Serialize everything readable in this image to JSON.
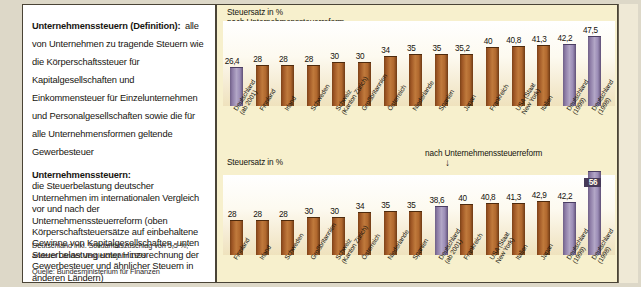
{
  "left_panel": {
    "definitions": [
      {
        "title": "Unternehmenssteuern (Definition):",
        "body": "alle von Unternehmen zu tragende Steuern wie die Körperschaftssteuer für Kapitalgesellschaften und Einkommensteuer für Einzelunternehmen und Personalgesellschaften sowie die für alle Unternehmensformen geltende Gewerbesteuer"
      },
      {
        "title": "Unternehmenssteuern:",
        "body": "die Steuerbelastung deutscher Unternehmen im internationalen Vergleich vor und nach der Unternehmenssteuerreform (oben Körperschaftsteuersätze auf einbehaltene Gewinne von Kapitalgesellschaften, unten Steuerbelastung unter Hinzurechnung der Gewerbesteuer und ähnlicher Steuern in anderen Ländern)"
      }
    ],
    "footnotes": [
      "Deutschland inkl. Solidaritätszuschlag von 5,5 %;",
      "anderer Länder Vergleichsjahr 1999"
    ],
    "source": "Quelle: Bundesministerium für Finanzen"
  },
  "colors": {
    "bar_default": "#a8632c",
    "bar_germany": "#9b8cb6",
    "panel_background": "#f7f0cd",
    "plot_background": "#ffffff",
    "text": "#14120c",
    "highlight_label_bg": "#463a58"
  },
  "chart_data": [
    {
      "id": "top",
      "type": "bar",
      "title": "Steuersatz in %",
      "annotation": "nach Unternehmenssteuerreform",
      "annotation_arrow": "↓",
      "annotation_target_index": 0,
      "xlabel": "",
      "ylabel": "Steuersatz in %",
      "ylim": [
        0,
        50
      ],
      "grid": false,
      "legend": "none",
      "categories": [
        "Deutschland\n(ab 2001)",
        "Finnland",
        "Irland",
        "Schweden",
        "Schweiz\n(Kanton Zürich)",
        "Großbritannien",
        "Österreich",
        "Niederlande",
        "Spanien",
        "Japan",
        "Frankreich",
        "USA (Staat\nNew York)",
        "Italien",
        "Deutschland\n(1999)",
        "Deutschland\n(1998)"
      ],
      "values": [
        26.4,
        28,
        28,
        28,
        30,
        30,
        34,
        35,
        35,
        35.2,
        40,
        40.8,
        41.3,
        42.2,
        47.5
      ],
      "value_labels": [
        "26,4",
        "28",
        "28",
        "28",
        "30",
        "30",
        "34",
        "35",
        "35",
        "35,2",
        "40",
        "40,8",
        "41,3",
        "42,2",
        "47,5"
      ],
      "germany_flags": [
        true,
        false,
        false,
        false,
        false,
        false,
        false,
        false,
        false,
        false,
        false,
        false,
        false,
        true,
        true
      ],
      "highlight_flags": [
        false,
        false,
        false,
        false,
        false,
        false,
        false,
        false,
        false,
        false,
        false,
        false,
        false,
        false,
        false
      ]
    },
    {
      "id": "bottom",
      "type": "bar",
      "title": "Steuersatz in %",
      "annotation": "nach Unternehmenssteuerreform",
      "annotation_arrow": "↓",
      "annotation_target_index": 9,
      "xlabel": "",
      "ylabel": "Steuersatz in %",
      "ylim": [
        0,
        60
      ],
      "grid": false,
      "legend": "none",
      "categories": [
        "Finnland",
        "Irland",
        "Schweden",
        "Großbritannien",
        "Schweiz\n(Kanton Zürich)",
        "Österreich",
        "Niederlande",
        "Spanien",
        "Deutschland\n(ab 2001)",
        "Frankreich",
        "USA (Staat\nNew York)",
        "Italien",
        "Japan",
        "Deutschland\n(1999)",
        "Deutschland\n(1998)"
      ],
      "values": [
        28,
        28,
        28,
        30,
        30,
        34,
        35,
        35,
        38.6,
        40,
        40.8,
        41.3,
        42.9,
        42.2,
        56
      ],
      "value_labels": [
        "28",
        "28",
        "28",
        "30",
        "30",
        "34",
        "35",
        "35",
        "38,6",
        "40",
        "40,8",
        "41,3",
        "42,9",
        "42,2",
        "56"
      ],
      "germany_flags": [
        false,
        false,
        false,
        false,
        false,
        false,
        false,
        false,
        true,
        false,
        false,
        false,
        false,
        true,
        true
      ],
      "highlight_flags": [
        false,
        false,
        false,
        false,
        false,
        false,
        false,
        false,
        false,
        false,
        false,
        false,
        false,
        false,
        true
      ]
    }
  ]
}
